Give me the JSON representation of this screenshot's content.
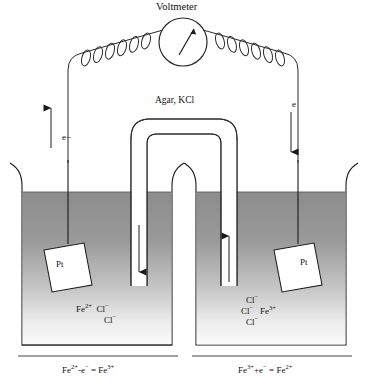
{
  "diagram": {
    "kind": "galvanic-electrochemical-cell",
    "title": "Voltmeter",
    "salt_bridge_label": "Agar, KCl",
    "electron_label_left": "e−",
    "electron_label_right": "e",
    "electrode_left_label": "Pt",
    "electrode_right_label": "Pt",
    "left_beaker": {
      "ions": [
        "Fe 2+",
        "Cl −",
        "Cl −"
      ],
      "ion_line_1_a": "Fe",
      "ion_line_1_a_sup": "2+",
      "ion_line_1_b": "Cl",
      "ion_line_1_b_sup": "−",
      "ion_line_2_b": "Cl",
      "ion_line_2_b_sup": "−",
      "equation_main": "Fe",
      "equation_sup1": "2+",
      "equation_mid": "-e",
      "equation_sup2": "−",
      "equation_eq": " = Fe",
      "equation_sup3": "3+"
    },
    "right_beaker": {
      "ions": [
        "Cl −",
        "Cl −",
        "Fe 3+",
        "Cl −"
      ],
      "ion_line_1_a": "Cl",
      "ion_line_1_a_sup": "−",
      "ion_line_2_a": "Cl",
      "ion_line_2_a_sup": "−",
      "ion_line_2_b": "Fe",
      "ion_line_2_b_sup": "3+",
      "ion_line_3_a": "Cl",
      "ion_line_3_a_sup": "−",
      "equation_main": "Fe",
      "equation_sup1": "3+",
      "equation_mid": "+e",
      "equation_sup2": "−",
      "equation_eq": " = Fe",
      "equation_sup3": "2+"
    },
    "colors": {
      "ink": "#1a1a1a",
      "liquid_top": "#8f8f8f",
      "liquid_bottom": "#fbfbfb",
      "electrode_fill": "#ffffff"
    }
  }
}
